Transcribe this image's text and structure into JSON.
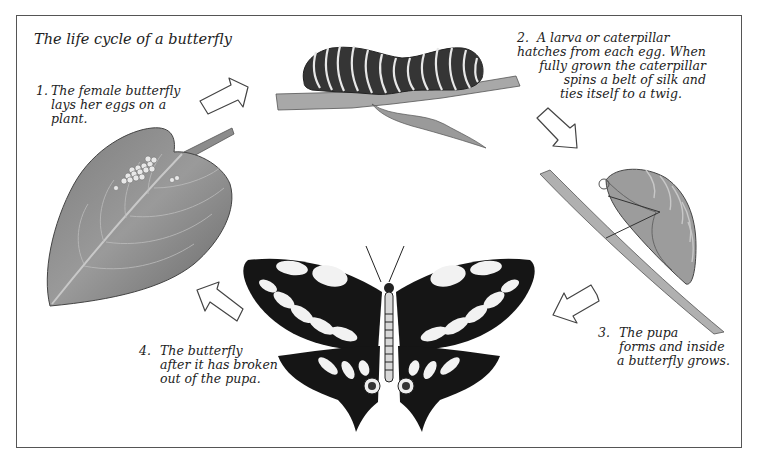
{
  "diagram": {
    "title": "The life cycle of a butterfly",
    "steps": [
      {
        "number": "1.",
        "lines": [
          "The female butterfly",
          "lays her eggs on a",
          "plant."
        ],
        "illustration": "leaf-with-eggs"
      },
      {
        "number": "2.",
        "lines": [
          "A larva or caterpillar",
          "hatches from each egg. When",
          "fully grown the caterpillar",
          "spins a belt of silk and",
          "ties itself to a twig."
        ],
        "illustration": "caterpillar-on-twig"
      },
      {
        "number": "3.",
        "lines": [
          "The pupa",
          "forms and inside",
          "a butterfly grows."
        ],
        "illustration": "pupa-on-twig"
      },
      {
        "number": "4.",
        "lines": [
          "The butterfly",
          "after it has broken",
          "out of the pupa."
        ],
        "illustration": "swallowtail-butterfly"
      }
    ],
    "arrows": [
      "arrow-1-to-2",
      "arrow-2-to-3",
      "arrow-3-to-4",
      "arrow-4-to-1"
    ],
    "colors": {
      "frame": "#555555",
      "text": "#222222",
      "leaf": "#8a8a8a",
      "caterpillar": "#3a3a3a",
      "wing_black": "#151515",
      "wing_white": "#f4f4f4"
    }
  }
}
